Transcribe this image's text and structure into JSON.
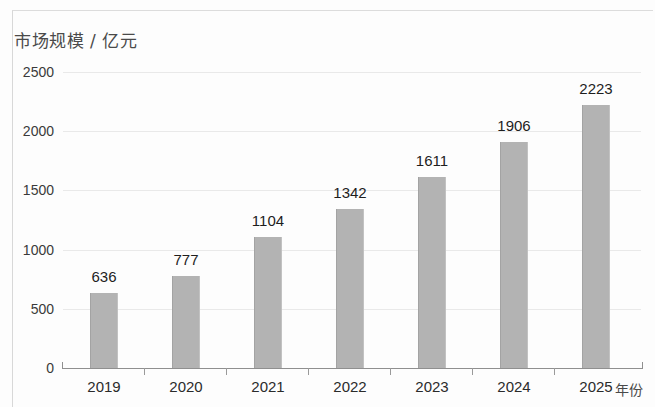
{
  "chart_data": {
    "type": "bar",
    "title": "市场规模 / 亿元",
    "xlabel": "年份",
    "ylabel": "市场规模 / 亿元",
    "categories": [
      "2019",
      "2020",
      "2021",
      "2022",
      "2023",
      "2024",
      "2025"
    ],
    "values": [
      636,
      777,
      1104,
      1342,
      1611,
      1906,
      2223
    ],
    "data_labels": [
      "636",
      "777",
      "1104",
      "1342",
      "1611",
      "1906",
      "2223"
    ],
    "ytick_labels": [
      "2500",
      "2000",
      "1500",
      "1000",
      "500",
      "0"
    ],
    "ytick_values": [
      2500,
      2000,
      1500,
      1000,
      500,
      0
    ],
    "ylim": [
      0,
      2500
    ],
    "grid": true,
    "legend": "none",
    "bar_color": "#b3b3b3",
    "gridline_color": "#e9e9e9",
    "axis_color": "#8f8f8f",
    "text_color": "#1e1e1e",
    "background_color": "#fdfdfd"
  }
}
